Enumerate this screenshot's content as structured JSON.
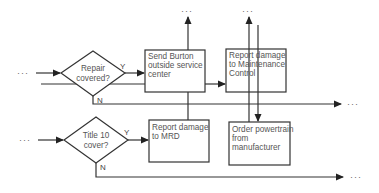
{
  "diagram": {
    "type": "flowchart",
    "decisions": [
      {
        "id": "repair_covered",
        "lines": [
          "Repair",
          "covered?"
        ],
        "yes_label": "Y",
        "no_label": "N"
      },
      {
        "id": "title10_cover",
        "lines": [
          "Title 10",
          "cover?"
        ],
        "yes_label": "Y",
        "no_label": "N"
      }
    ],
    "processes": [
      {
        "id": "send_burton",
        "lines": [
          "Send Burton",
          "outside service",
          "center"
        ]
      },
      {
        "id": "report_maint",
        "lines": [
          "Report damage",
          "to Maintenance",
          "Control"
        ]
      },
      {
        "id": "report_mrd",
        "lines": [
          "Report damage",
          "to MRD"
        ]
      },
      {
        "id": "order_powertrain",
        "lines": [
          "Order powertrain",
          "from",
          "manufacturer"
        ]
      }
    ],
    "continuation": "···",
    "edges": [
      {
        "from": "entry-1",
        "to": "repair_covered"
      },
      {
        "from": "repair_covered",
        "to": "send_burton",
        "label": "Y"
      },
      {
        "from": "repair_covered",
        "to": "exit-right-1",
        "label": "N"
      },
      {
        "from": "send_burton",
        "to": "exit-top-1"
      },
      {
        "from": "send_burton",
        "to": "report_maint"
      },
      {
        "from": "send_burton",
        "to": "report_mrd"
      },
      {
        "from": "report_maint",
        "to": "exit-top-2"
      },
      {
        "from": "report_maint",
        "to": "order_powertrain"
      },
      {
        "from": "entry-2",
        "to": "title10_cover"
      },
      {
        "from": "title10_cover",
        "to": "report_mrd",
        "label": "Y"
      },
      {
        "from": "title10_cover",
        "to": "exit-right-2",
        "label": "N"
      }
    ]
  }
}
